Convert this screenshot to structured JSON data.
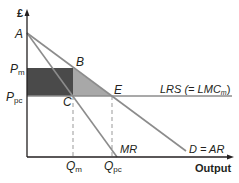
{
  "diagram": {
    "y_axis_label": "£",
    "x_axis_label": "Output",
    "points": {
      "A": "A",
      "B": "B",
      "C": "C",
      "E": "E"
    },
    "price_labels": {
      "pm_main": "P",
      "pm_sub": "m",
      "ppc_main": "P",
      "ppc_sub": "pc"
    },
    "quantity_labels": {
      "qm_main": "Q",
      "qm_sub": "m",
      "qpc_main": "Q",
      "qpc_sub": "pc"
    },
    "curves": {
      "lrs_main": "LRS (= LMC",
      "lrs_sub": "m",
      "lrs_close": ")",
      "mr": "MR",
      "demand": "D = AR"
    },
    "colors": {
      "axis": "#231f20",
      "curve": "#8c8c8c",
      "profit_rect": "#4a4a4a",
      "deadweight": "#a8a8a8",
      "dashed": "#999999"
    }
  }
}
